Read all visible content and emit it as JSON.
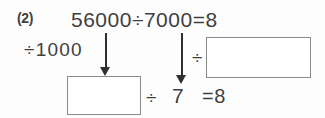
{
  "problem": {
    "number_label": "(2)",
    "main_equation": "56000÷7000=8",
    "divisor_label": "÷1000",
    "mid_divide_sign": "÷",
    "bottom_divide_sign": "÷",
    "bottom_seven": "7",
    "bottom_result": "=8"
  },
  "answer_boxes": [
    {
      "name": "left-answer-box",
      "value": ""
    },
    {
      "name": "right-answer-box",
      "value": ""
    }
  ],
  "arrows": [
    {
      "name": "arrow-from-dividend",
      "direction": "down"
    },
    {
      "name": "arrow-from-divisor",
      "direction": "down"
    }
  ],
  "colors": {
    "background": "#fdfdfd",
    "text": "#3f3f3f",
    "box_stroke": "#8a8a8a",
    "arrow": "#2f2f2f"
  }
}
